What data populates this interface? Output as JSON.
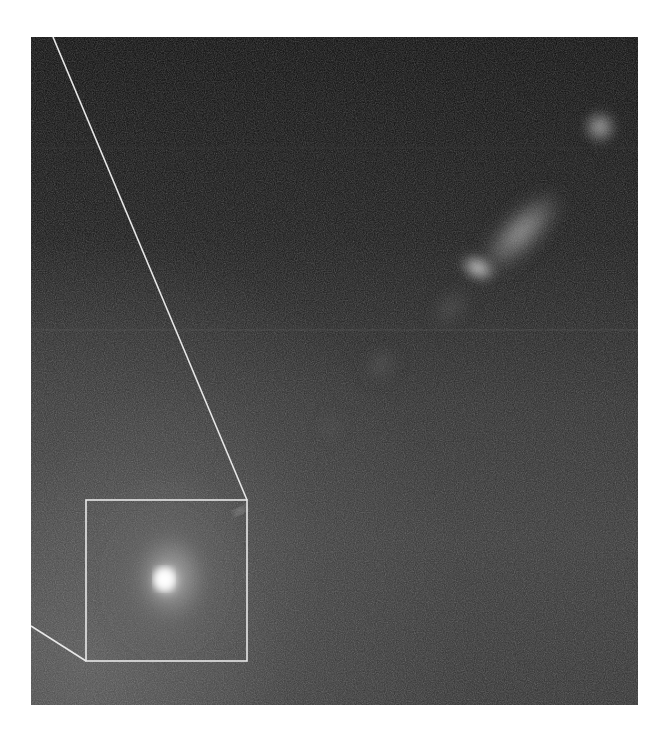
{
  "figure": {
    "type": "astronomical-image",
    "colors": {
      "background": "#ffffff",
      "sky_dark": "#0a0a0a",
      "sky_mid": "#303030",
      "annotation_lines": "#e8e8e8"
    },
    "inset_box": {
      "x": 86,
      "y": 500,
      "width": 161,
      "height": 161
    },
    "projection_lines": [
      {
        "from": [
          53,
          37
        ],
        "to": [
          247,
          500
        ]
      },
      {
        "from": [
          31,
          626
        ],
        "to": [
          86,
          661
        ]
      }
    ],
    "features": [
      {
        "name": "galaxy-core",
        "x": 166,
        "y": 580
      },
      {
        "name": "jet-knot-bright",
        "x": 478,
        "y": 268
      },
      {
        "name": "jet-extended",
        "x": 530,
        "y": 225
      },
      {
        "name": "jet-terminal-blob",
        "x": 600,
        "y": 127
      },
      {
        "name": "jet-faint-knot",
        "x": 380,
        "y": 365
      }
    ]
  }
}
